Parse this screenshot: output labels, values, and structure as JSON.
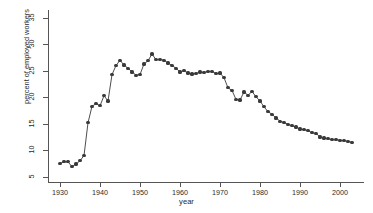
{
  "chart_data": {
    "type": "line",
    "title": "",
    "subtitle": "",
    "xlabel": "year",
    "ylabel": "percent of employed workers",
    "xlim": [
      1927,
      2006
    ],
    "ylim": [
      4.0,
      36.5
    ],
    "xticks": [
      1930,
      1940,
      1950,
      1960,
      1970,
      1980,
      1990,
      2000
    ],
    "yticks": [
      5,
      10,
      15,
      20,
      25,
      30,
      35
    ],
    "grid": false,
    "legend": null,
    "marker": "filled-circle",
    "line_color": "#3a3a3a",
    "marker_color": "#3a3a3a",
    "x": [
      1930,
      1931,
      1932,
      1933,
      1934,
      1935,
      1936,
      1937,
      1938,
      1939,
      1940,
      1941,
      1942,
      1943,
      1944,
      1945,
      1946,
      1947,
      1948,
      1949,
      1950,
      1951,
      1952,
      1953,
      1954,
      1955,
      1956,
      1957,
      1958,
      1959,
      1960,
      1961,
      1962,
      1963,
      1964,
      1965,
      1966,
      1967,
      1968,
      1969,
      1970,
      1971,
      1972,
      1973,
      1974,
      1975,
      1976,
      1977,
      1978,
      1979,
      1980,
      1981,
      1982,
      1983,
      1984,
      1985,
      1986,
      1987,
      1988,
      1989,
      1990,
      1991,
      1992,
      1993,
      1994,
      1995,
      1996,
      1997,
      1998,
      1999,
      2000,
      2001,
      2002,
      2003
    ],
    "values": [
      7.5,
      7.8,
      7.8,
      6.9,
      7.4,
      8.0,
      9.0,
      15.2,
      18.3,
      18.8,
      18.4,
      20.3,
      19.3,
      24.3,
      26.0,
      27.0,
      26.1,
      25.5,
      24.8,
      24.2,
      24.3,
      26.3,
      26.9,
      28.2,
      27.1,
      27.2,
      27.0,
      26.5,
      26.0,
      25.5,
      24.8,
      25.0,
      24.6,
      24.4,
      24.5,
      24.8,
      24.7,
      24.9,
      24.9,
      24.5,
      24.6,
      23.7,
      21.8,
      21.3,
      19.6,
      19.5,
      21.0,
      20.4,
      21.1,
      20.1,
      19.3,
      18.2,
      17.3,
      16.8,
      16.1,
      15.5,
      15.2,
      14.9,
      14.6,
      14.4,
      14.0,
      13.9,
      13.7,
      13.3,
      13.2,
      12.5,
      12.3,
      12.2,
      12.0,
      12.0,
      11.9,
      11.8,
      11.7,
      11.5
    ],
    "yunit": "percent"
  },
  "axis": {
    "ytick_labels": [
      "35",
      "30",
      "25",
      "20",
      "15",
      "10",
      "5"
    ],
    "xtick_labels": [
      "1930",
      "1940",
      "1950",
      "1960",
      "1970",
      "1980",
      "1990",
      "2000"
    ]
  }
}
